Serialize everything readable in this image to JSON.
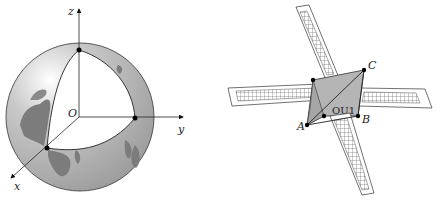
{
  "figures": [
    {
      "id": "earth",
      "title": "Earth with coordinate axes",
      "labels": {
        "z_axis": "z",
        "y_axis": "y",
        "x_axis": "x",
        "origin": "O"
      },
      "colors": {
        "globe_fill": "#a9a9a9",
        "land": "#7c7c7c",
        "cutout": "#ffffff",
        "outline": "#333333"
      }
    },
    {
      "id": "satellite",
      "title": "Satellite with solar panels",
      "labels": {
        "point_a": "A",
        "point_b": "B",
        "point_c": "C",
        "body": "OU1"
      },
      "colors": {
        "body_fill": "#b5b5b5",
        "panel_fill": "#ffffff",
        "grid": "#555555",
        "outline": "#333333"
      }
    }
  ]
}
